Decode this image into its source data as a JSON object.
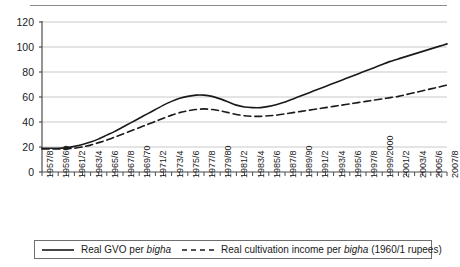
{
  "chart_data": {
    "type": "line",
    "title": "",
    "xlabel": "",
    "ylabel": "",
    "ylim": [
      0,
      120
    ],
    "yticks": [
      0,
      20,
      40,
      60,
      80,
      100,
      120
    ],
    "grid": true,
    "legend_position": "below-axes",
    "x_tick_interval_years": 1,
    "x_label_interval_years": 2,
    "categories": [
      "1957/8",
      "1958/9",
      "1959/60",
      "1960/1",
      "1961/2",
      "1962/3",
      "1963/4",
      "1964/5",
      "1965/6",
      "1966/7",
      "1967/8",
      "1968/9",
      "1969/70",
      "1970/1",
      "1971/2",
      "1972/3",
      "1973/4",
      "1974/5",
      "1975/6",
      "1976/7",
      "1977/8",
      "1978/9",
      "1979/80",
      "1980/1",
      "1981/2",
      "1982/3",
      "1983/4",
      "1984/5",
      "1985/6",
      "1986/7",
      "1987/8",
      "1988/9",
      "1989/90",
      "1990/1",
      "1991/2",
      "1992/3",
      "1993/4",
      "1994/5",
      "1995/6",
      "1996/7",
      "1997/8",
      "1998/9",
      "1999/2000",
      "2000/1",
      "2001/2",
      "2002/3",
      "2003/4",
      "2004/5",
      "2005/6",
      "2006/7",
      "2007/8"
    ],
    "tick_labels": [
      "1957/8",
      "1959/60",
      "1961/2",
      "1963/4",
      "1965/6",
      "1967/8",
      "1969/70",
      "1971/2",
      "1973/4",
      "1975/6",
      "1977/8",
      "1979/80",
      "1981/2",
      "1983/4",
      "1985/6",
      "1987/8",
      "1989/90",
      "1991/2",
      "1993/4",
      "1995/6",
      "1997/8",
      "1999/2000",
      "2001/2",
      "2003/4",
      "2005/6",
      "2007/8"
    ],
    "series": [
      {
        "name": "Real GVO per bigha",
        "style": "solid",
        "color": "#1a1a1a",
        "values": [
          19,
          19,
          19,
          19.5,
          20.5,
          22,
          24,
          26.5,
          29.5,
          32.5,
          36,
          39.5,
          43,
          46.5,
          50,
          53.5,
          56.5,
          59,
          60.5,
          61.5,
          61.5,
          60.5,
          58.5,
          56,
          53.5,
          52,
          51.5,
          51.5,
          52.5,
          54,
          56,
          58.5,
          61,
          63.5,
          66,
          68.5,
          71,
          73.5,
          76,
          78.5,
          81,
          83.5,
          86,
          88.5,
          90.5,
          92.5,
          94.5,
          96.5,
          98.5,
          100.5,
          102.5
        ]
      },
      {
        "name": "Real cultivation income per bigha (1960/1 rupees)",
        "style": "dashed",
        "color": "#1a1a1a",
        "values": [
          18.5,
          18.5,
          18.5,
          18.5,
          19,
          20,
          21.5,
          23.5,
          25.5,
          28,
          30.5,
          33,
          35.5,
          38,
          40.5,
          43,
          45.5,
          47.5,
          49,
          50,
          50.5,
          50,
          49,
          47.5,
          46,
          45,
          44.5,
          44.5,
          45,
          45.5,
          46.5,
          47.5,
          48.5,
          49.5,
          50.5,
          51.5,
          52.5,
          53.5,
          54.5,
          55.5,
          56.5,
          57.5,
          58.5,
          59.5,
          60.5,
          62,
          63.5,
          65,
          66.5,
          68,
          69.5
        ]
      }
    ]
  },
  "legend": {
    "entries": [
      {
        "label_prefix": "Real GVO per ",
        "label_italic": "bigha",
        "label_suffix": ""
      },
      {
        "label_prefix": "Real cultivation income per ",
        "label_italic": "bigha",
        "label_suffix": " (1960/1 rupees)"
      }
    ]
  },
  "colors": {
    "line": "#1a1a1a",
    "grid": "#c9c9c9",
    "axis": "#4d4d4d",
    "rule": "#8a8a8a"
  }
}
